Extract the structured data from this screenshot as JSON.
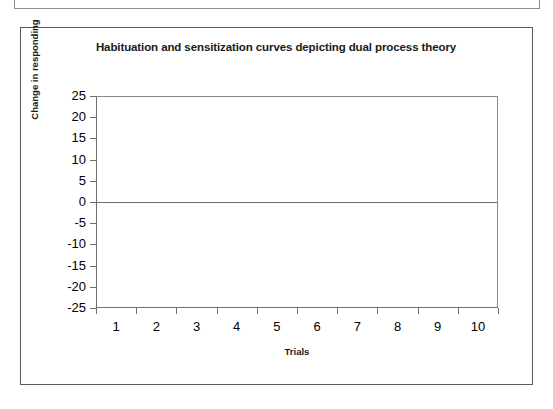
{
  "figure": {
    "title": "Habituation and sensitization curves depicting dual process theory"
  },
  "chart_data": {
    "type": "line",
    "title": "Habituation and sensitization curves depicting dual process theory",
    "xlabel": "Trials",
    "ylabel": "Change in responding",
    "x": [
      1,
      2,
      3,
      4,
      5,
      6,
      7,
      8,
      9,
      10
    ],
    "categories": [
      "1",
      "2",
      "3",
      "4",
      "5",
      "6",
      "7",
      "8",
      "9",
      "10"
    ],
    "xtick_labels": [
      "1",
      "2",
      "3",
      "4",
      "5",
      "6",
      "7",
      "8",
      "9",
      "10"
    ],
    "ytick_labels": [
      "25",
      "20",
      "15",
      "10",
      "5",
      "0",
      "-5",
      "-10",
      "-15",
      "-20",
      "-25"
    ],
    "ytick_values": [
      25,
      20,
      15,
      10,
      5,
      0,
      -5,
      -10,
      -15,
      -20,
      -25
    ],
    "ylim": [
      -25,
      25
    ],
    "grid": false,
    "legend": null,
    "series": [
      {
        "name": "zero reference line",
        "values": [
          0,
          0,
          0,
          0,
          0,
          0,
          0,
          0,
          0,
          0
        ],
        "color": "#6b6b6b"
      }
    ],
    "annotations": []
  },
  "colors": {
    "plot_background": "#ffffff",
    "axis_line": "#6f6f6f",
    "frame_border": "#5a5a5a",
    "text": "#000000"
  }
}
